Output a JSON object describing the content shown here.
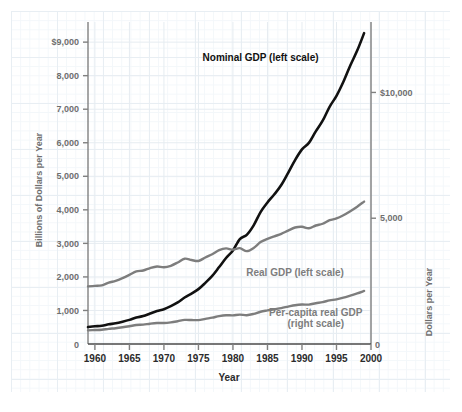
{
  "chart_data": {
    "type": "line",
    "title": "",
    "xlabel": "Year",
    "ylabel": "Billions of Dollars per Year",
    "y2label": "Dollars per Year",
    "xlim": [
      1959,
      2000
    ],
    "ylim": [
      0,
      9600
    ],
    "y2lim": [
      0,
      12800
    ],
    "grid": true,
    "legend_position": "inline-annotations",
    "x_ticks": [
      "1960",
      "1965",
      "1970",
      "1975",
      "1980",
      "1985",
      "1990",
      "1995",
      "2000"
    ],
    "x_tick_values": [
      1960,
      1965,
      1970,
      1975,
      1980,
      1985,
      1990,
      1995,
      2000
    ],
    "y_ticks": [
      "0",
      "1,000",
      "2,000",
      "3,000",
      "4,000",
      "5,000",
      "6,000",
      "7,000",
      "8,000",
      "$9,000"
    ],
    "y_tick_values": [
      0,
      1000,
      2000,
      3000,
      4000,
      5000,
      6000,
      7000,
      8000,
      9000
    ],
    "y2_ticks": [
      "0",
      "5,000",
      "$10,000"
    ],
    "y2_tick_values": [
      0,
      5000,
      10000
    ],
    "annotations": [
      {
        "text": "Nominal GDP (left scale)",
        "color": "#111111",
        "x": 1984,
        "y": 8450
      },
      {
        "text": "Real GDP (left scale)",
        "color": "#7d7d7d",
        "x": 1989,
        "y": 2030
      },
      {
        "text": "Per-capita real GDP",
        "color": "#7d7d7d",
        "x": 1992,
        "y": 830
      },
      {
        "text": "(right scale)",
        "color": "#7d7d7d",
        "x": 1992,
        "y": 510
      }
    ],
    "x": [
      1959,
      1960,
      1961,
      1962,
      1963,
      1964,
      1965,
      1966,
      1967,
      1968,
      1969,
      1970,
      1971,
      1972,
      1973,
      1974,
      1975,
      1976,
      1977,
      1978,
      1979,
      1980,
      1981,
      1982,
      1983,
      1984,
      1985,
      1986,
      1987,
      1988,
      1989,
      1990,
      1991,
      1992,
      1993,
      1994,
      1995,
      1996,
      1997,
      1998,
      1999
    ],
    "series": [
      {
        "name": "Nominal GDP (left scale)",
        "axis": "left",
        "color": "#111111",
        "width": 2.6,
        "values": [
          506,
          527,
          545,
          586,
          618,
          664,
          719,
          788,
          833,
          910,
          985,
          1039,
          1128,
          1240,
          1386,
          1501,
          1636,
          1824,
          2030,
          2294,
          2563,
          2790,
          3128,
          3255,
          3537,
          3933,
          4220,
          4463,
          4740,
          5104,
          5484,
          5803,
          5996,
          6338,
          6657,
          7072,
          7398,
          7817,
          8304,
          8747,
          9268
        ]
      },
      {
        "name": "Real GDP (left scale)",
        "axis": "left",
        "color": "#7d7d7d",
        "width": 2.4,
        "values": [
          406,
          416,
          426,
          452,
          471,
          498,
          530,
          565,
          578,
          605,
          624,
          625,
          645,
          679,
          718,
          714,
          713,
          751,
          786,
          830,
          856,
          854,
          876,
          858,
          897,
          962,
          1001,
          1036,
          1071,
          1115,
          1156,
          1177,
          1175,
          1216,
          1250,
          1301,
          1332,
          1382,
          1444,
          1509,
          1581
        ]
      },
      {
        "name": "Per-capita real GDP (right scale)",
        "axis": "right",
        "color": "#7d7d7d",
        "width": 2.4,
        "values": [
          2290,
          2310,
          2330,
          2440,
          2510,
          2620,
          2750,
          2890,
          2920,
          3020,
          3080,
          3050,
          3110,
          3240,
          3390,
          3340,
          3300,
          3440,
          3570,
          3730,
          3800,
          3750,
          3810,
          3690,
          3820,
          4050,
          4180,
          4280,
          4380,
          4510,
          4630,
          4660,
          4600,
          4710,
          4780,
          4920,
          4990,
          5120,
          5280,
          5460,
          5660
        ]
      }
    ]
  },
  "axes": {
    "left_title": "Billions of Dollars per Year",
    "right_title": "Dollars per Year",
    "bottom_title": "Year"
  }
}
